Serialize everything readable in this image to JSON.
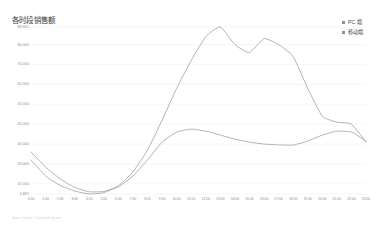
{
  "chart_data": {
    "type": "line",
    "title": "各时段销售额",
    "xlabel": "",
    "ylabel": "",
    "grid": true,
    "legend_position": "top-right",
    "ylim": [
      4887,
      88841
    ],
    "ytick_labels": [
      "88,841",
      "80,000",
      "70,000",
      "60,000",
      "50,000",
      "40,000",
      "30,000",
      "20,000",
      "10,000",
      "4,887"
    ],
    "ytick_values": [
      88841,
      80000,
      70000,
      60000,
      50000,
      40000,
      30000,
      20000,
      10000,
      4887
    ],
    "categories": [
      "0:00",
      "1:00",
      "2:00",
      "3:00",
      "4:00",
      "5:00",
      "6:00",
      "7:00",
      "8:00",
      "9:00",
      "10:00",
      "11:00",
      "12:00",
      "13:00",
      "14:00",
      "15:00",
      "16:00",
      "17:00",
      "18:00",
      "19:00",
      "20:00",
      "21:00",
      "22:00",
      "23:00"
    ],
    "series": [
      {
        "name": "PC 端",
        "color": "#9a9a9a",
        "values": [
          22000,
          14000,
          9200,
          6400,
          4887,
          5600,
          9000,
          16000,
          27000,
          42000,
          58000,
          72000,
          84000,
          88841,
          80000,
          76000,
          83000,
          80000,
          74000,
          58000,
          44000,
          41000,
          40000,
          31000
        ]
      },
      {
        "name": "移动端",
        "color": "#9a9a9a",
        "values": [
          26000,
          18500,
          12500,
          8200,
          6000,
          6200,
          8500,
          14000,
          22000,
          31000,
          36000,
          37500,
          36500,
          34500,
          32500,
          31000,
          30000,
          29600,
          29500,
          31500,
          34500,
          36500,
          36000,
          31500
        ]
      }
    ]
  },
  "legend": {
    "items": [
      {
        "label": "PC 端"
      },
      {
        "label": "移动端"
      }
    ]
  },
  "footnote": {
    "text": "Store Details Chart built by me"
  }
}
